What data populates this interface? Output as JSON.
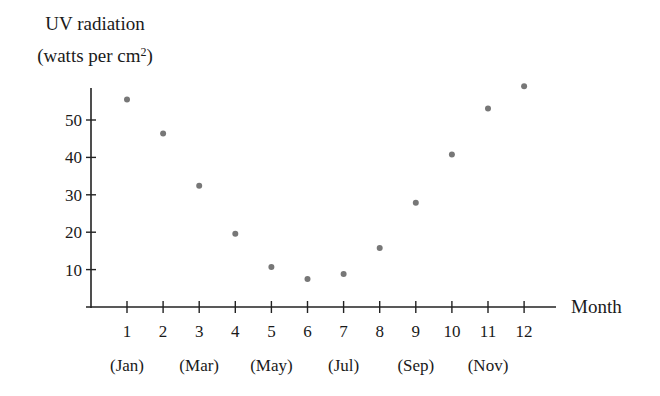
{
  "chart_data": {
    "type": "scatter",
    "title": "",
    "ylabel_line1": "UV radiation",
    "ylabel_line2_prefix": "(watts per cm",
    "ylabel_line2_sup": "2",
    "ylabel_line2_suffix": ")",
    "xlabel": "Month",
    "x": [
      1,
      2,
      3,
      4,
      5,
      6,
      7,
      8,
      9,
      10,
      11,
      12
    ],
    "x_tick_labels": [
      "1",
      "2",
      "3",
      "4",
      "5",
      "6",
      "7",
      "8",
      "9",
      "10",
      "11",
      "12"
    ],
    "x_month_labels": [
      {
        "month": 1,
        "label": "(Jan)"
      },
      {
        "month": 3,
        "label": "(Mar)"
      },
      {
        "month": 5,
        "label": "(May)"
      },
      {
        "month": 7,
        "label": "(Jul)"
      },
      {
        "month": 9,
        "label": "(Sep)"
      },
      {
        "month": 11,
        "label": "(Nov)"
      }
    ],
    "y": [
      55.5,
      46.4,
      32.4,
      19.6,
      10.7,
      7.5,
      8.8,
      15.8,
      27.9,
      40.8,
      53.1,
      59.0
    ],
    "y_ticks": [
      10,
      20,
      30,
      40,
      50
    ],
    "y_tick_labels": [
      "10",
      "20",
      "30",
      "40",
      "50"
    ],
    "xlim": [
      0,
      12.9
    ],
    "ylim": [
      0,
      58.5
    ],
    "grid": false,
    "legend": null,
    "marker_color": "#777777"
  }
}
